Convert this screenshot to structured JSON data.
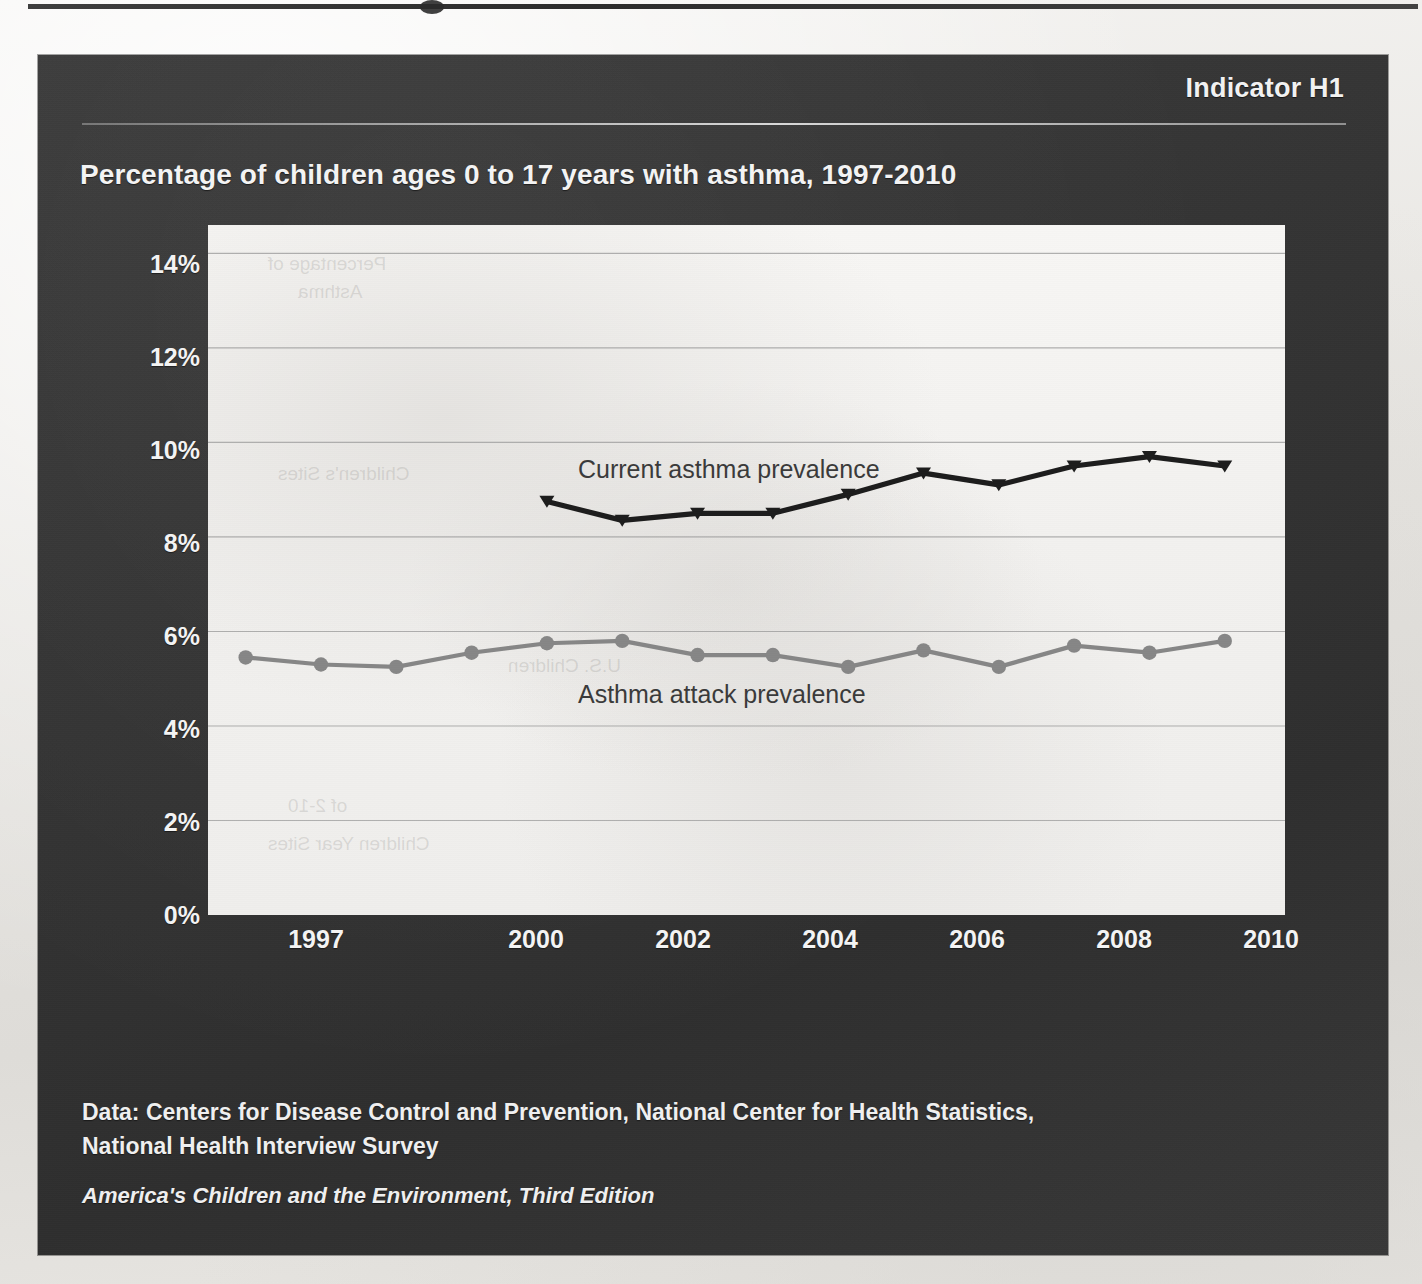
{
  "page": {
    "background_color": "#e9e7e4",
    "panel_color": "#343434",
    "text_color": "#f4f4f4"
  },
  "header": {
    "indicator": "Indicator H1",
    "title": "Percentage of children ages 0 to 17 years with asthma, 1997-2010"
  },
  "footer": {
    "data_source_line1": "Data: Centers for Disease Control and Prevention, National Center for Health Statistics,",
    "data_source_line2": "National Health Interview Survey",
    "edition": "America's Children and the Environment, Third Edition"
  },
  "chart_data": {
    "type": "line",
    "title": "Percentage of children ages 0 to 17 years with asthma, 1997-2010",
    "xlabel": "",
    "ylabel": "",
    "x": [
      1997,
      1998,
      1999,
      2000,
      2001,
      2002,
      2003,
      2004,
      2005,
      2006,
      2007,
      2008,
      2009,
      2010
    ],
    "xtick_labels": [
      "1997",
      "2000",
      "2002",
      "2004",
      "2006",
      "2008",
      "2010"
    ],
    "xticks": [
      1997,
      2000,
      2002,
      2004,
      2006,
      2008,
      2010
    ],
    "xlim": [
      1996.5,
      2010.8
    ],
    "ylim": [
      0,
      14.6
    ],
    "yticks": [
      0,
      2,
      4,
      6,
      8,
      10,
      12,
      14
    ],
    "ytick_labels": [
      "0%",
      "2%",
      "4%",
      "6%",
      "8%",
      "10%",
      "12%",
      "14%"
    ],
    "grid": "horizontal",
    "legend": "inline-annotations",
    "series": [
      {
        "name": "Current asthma prevalence",
        "color": "#1c1c1c",
        "marker": "triangle",
        "x": [
          2001,
          2002,
          2003,
          2004,
          2005,
          2006,
          2007,
          2008,
          2009,
          2010
        ],
        "values": [
          8.75,
          8.35,
          8.5,
          8.5,
          8.9,
          9.35,
          9.1,
          9.5,
          9.7,
          9.5
        ],
        "label_text": "Current asthma prevalence"
      },
      {
        "name": "Asthma attack prevalence",
        "color": "#868686",
        "marker": "circle",
        "x": [
          1997,
          1998,
          1999,
          2000,
          2001,
          2002,
          2003,
          2004,
          2005,
          2006,
          2007,
          2008,
          2009,
          2010
        ],
        "values": [
          5.45,
          5.3,
          5.25,
          5.55,
          5.75,
          5.8,
          5.5,
          5.5,
          5.25,
          5.6,
          5.25,
          5.7,
          5.55,
          5.8
        ],
        "label_text": "Asthma attack prevalence"
      }
    ]
  }
}
